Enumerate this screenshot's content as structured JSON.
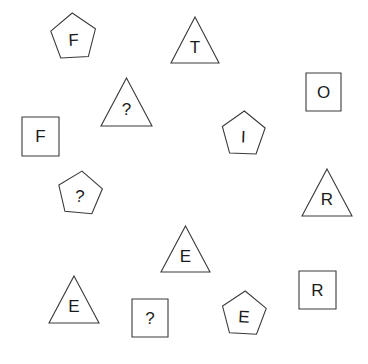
{
  "scene": {
    "width": 368,
    "height": 364,
    "background_color": "#ffffff",
    "stroke_color": "#3a3a3a",
    "text_color": "#1b1b1b",
    "description": "Scattered outlined geometric shapes each containing a single character"
  },
  "shapes": [
    {
      "id": "pentagon-f",
      "kind": "pentagon",
      "label": "F",
      "x": 50,
      "y": 13,
      "width": 47,
      "height": 49,
      "rotation": -3
    },
    {
      "id": "triangle-t",
      "kind": "triangle",
      "label": "T",
      "x": 171,
      "y": 17,
      "width": 48,
      "height": 46,
      "rotation": 0
    },
    {
      "id": "triangle-question-upper",
      "kind": "triangle",
      "label": "?",
      "x": 101,
      "y": 78,
      "width": 51,
      "height": 48,
      "rotation": 0
    },
    {
      "id": "square-o",
      "kind": "square",
      "label": "O",
      "x": 306,
      "y": 73,
      "width": 35,
      "height": 38,
      "rotation": 0
    },
    {
      "id": "square-f",
      "kind": "square",
      "label": "F",
      "x": 22,
      "y": 117,
      "width": 37,
      "height": 39,
      "rotation": 0
    },
    {
      "id": "pentagon-i",
      "kind": "pentagon",
      "label": "I",
      "x": 221,
      "y": 111,
      "width": 45,
      "height": 47,
      "rotation": 2
    },
    {
      "id": "pentagon-question-left",
      "kind": "pentagon",
      "label": "?",
      "x": 57,
      "y": 171,
      "width": 46,
      "height": 46,
      "rotation": 5
    },
    {
      "id": "triangle-r",
      "kind": "triangle",
      "label": "R",
      "x": 302,
      "y": 169,
      "width": 50,
      "height": 47,
      "rotation": 0
    },
    {
      "id": "triangle-e-middle",
      "kind": "triangle",
      "label": "E",
      "x": 161,
      "y": 226,
      "width": 49,
      "height": 46,
      "rotation": 0
    },
    {
      "id": "square-r",
      "kind": "square",
      "label": "R",
      "x": 299,
      "y": 271,
      "width": 37,
      "height": 38,
      "rotation": 0
    },
    {
      "id": "triangle-e-lower-left",
      "kind": "triangle",
      "label": "E",
      "x": 49,
      "y": 276,
      "width": 50,
      "height": 47,
      "rotation": 0
    },
    {
      "id": "square-question-lower",
      "kind": "square",
      "label": "?",
      "x": 132,
      "y": 299,
      "width": 36,
      "height": 38,
      "rotation": 0
    },
    {
      "id": "pentagon-e",
      "kind": "pentagon",
      "label": "E",
      "x": 221,
      "y": 291,
      "width": 46,
      "height": 47,
      "rotation": 3
    }
  ]
}
